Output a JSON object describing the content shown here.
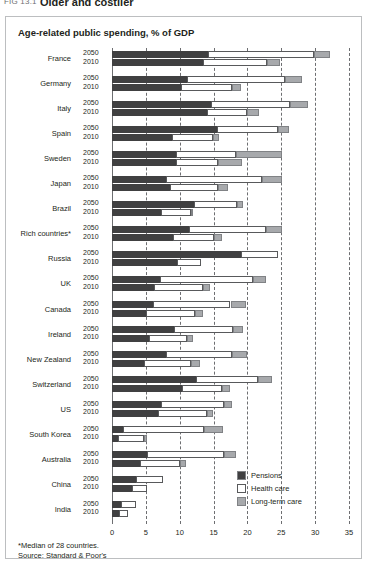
{
  "figure": {
    "label": "FIG 13.1",
    "caption": "Older and costlier"
  },
  "chart_title": "Age-related public spending, % of GDP",
  "notes": {
    "footnote": "*Median of 28 countries.",
    "source": "Source: Standard & Poor's"
  },
  "legend": {
    "position": "bottom-right",
    "items": [
      {
        "label": "Pensions",
        "color": "#404041"
      },
      {
        "label": "Health care",
        "color": "#ffffff"
      },
      {
        "label": "Long-term care",
        "color": "#a7a9ac"
      }
    ]
  },
  "chart_data": {
    "type": "bar",
    "orientation": "horizontal",
    "stacked": true,
    "title": "Age-related public spending, % of GDP",
    "xlabel": "",
    "ylabel": "",
    "xlim": [
      0,
      35
    ],
    "xticks": [
      0,
      5,
      10,
      15,
      20,
      25,
      30,
      35
    ],
    "grid": true,
    "series_names": [
      "Pensions",
      "Health care",
      "Long-term care"
    ],
    "year_labels": [
      "2050",
      "2010"
    ],
    "categories": [
      "France",
      "Germany",
      "Italy",
      "Spain",
      "Sweden",
      "Japan",
      "Brazil",
      "Rich countries*",
      "Russia",
      "UK",
      "Canada",
      "Ireland",
      "New Zealand",
      "Switzerland",
      "US",
      "South Korea",
      "Australia",
      "China",
      "India"
    ],
    "rows": [
      {
        "country": "France",
        "year": "2050",
        "pensions": 14.2,
        "health": 15.6,
        "longterm": 2.4,
        "total": 32.2
      },
      {
        "country": "France",
        "year": "2010",
        "pensions": 13.5,
        "health": 9.4,
        "longterm": 1.9,
        "total": 24.8
      },
      {
        "country": "Germany",
        "year": "2050",
        "pensions": 11.1,
        "health": 14.5,
        "longterm": 2.5,
        "total": 28.1
      },
      {
        "country": "Germany",
        "year": "2010",
        "pensions": 10.2,
        "health": 7.5,
        "longterm": 1.3,
        "total": 19.0
      },
      {
        "country": "Italy",
        "year": "2050",
        "pensions": 14.6,
        "health": 11.7,
        "longterm": 2.6,
        "total": 28.9
      },
      {
        "country": "Italy",
        "year": "2010",
        "pensions": 14.0,
        "health": 5.9,
        "longterm": 1.8,
        "total": 21.7
      },
      {
        "country": "Spain",
        "year": "2050",
        "pensions": 15.5,
        "health": 9.0,
        "longterm": 1.6,
        "total": 26.1
      },
      {
        "country": "Spain",
        "year": "2010",
        "pensions": 8.9,
        "health": 6.0,
        "longterm": 0.9,
        "total": 15.8
      },
      {
        "country": "Sweden",
        "year": "2050",
        "pensions": 9.4,
        "health": 8.9,
        "longterm": 6.8,
        "total": 25.1
      },
      {
        "country": "Sweden",
        "year": "2010",
        "pensions": 9.5,
        "health": 6.1,
        "longterm": 3.6,
        "total": 19.2
      },
      {
        "country": "Japan",
        "year": "2050",
        "pensions": 8.0,
        "health": 14.1,
        "longterm": 3.0,
        "total": 25.1
      },
      {
        "country": "Japan",
        "year": "2010",
        "pensions": 8.6,
        "health": 7.0,
        "longterm": 1.5,
        "total": 17.1
      },
      {
        "country": "Brazil",
        "year": "2050",
        "pensions": 12.1,
        "health": 6.3,
        "longterm": 0.9,
        "total": 19.3
      },
      {
        "country": "Brazil",
        "year": "2010",
        "pensions": 7.2,
        "health": 4.4,
        "longterm": 0.4,
        "total": 12.0
      },
      {
        "country": "Rich countries*",
        "year": "2050",
        "pensions": 11.4,
        "health": 11.3,
        "longterm": 2.4,
        "total": 25.1
      },
      {
        "country": "Rich countries*",
        "year": "2010",
        "pensions": 9.0,
        "health": 6.1,
        "longterm": 1.1,
        "total": 16.2
      },
      {
        "country": "Russia",
        "year": "2050",
        "pensions": 19.0,
        "health": 5.5,
        "longterm": 0.0,
        "total": 24.5
      },
      {
        "country": "Russia",
        "year": "2010",
        "pensions": 9.6,
        "health": 3.6,
        "longterm": 0.0,
        "total": 13.2
      },
      {
        "country": "UK",
        "year": "2050",
        "pensions": 7.1,
        "health": 13.7,
        "longterm": 1.9,
        "total": 22.7
      },
      {
        "country": "UK",
        "year": "2010",
        "pensions": 6.2,
        "health": 7.3,
        "longterm": 1.0,
        "total": 14.5
      },
      {
        "country": "Canada",
        "year": "2050",
        "pensions": 6.1,
        "health": 11.4,
        "longterm": 2.3,
        "total": 19.8
      },
      {
        "country": "Canada",
        "year": "2010",
        "pensions": 5.0,
        "health": 7.3,
        "longterm": 1.2,
        "total": 13.5
      },
      {
        "country": "Ireland",
        "year": "2050",
        "pensions": 9.2,
        "health": 8.6,
        "longterm": 1.6,
        "total": 19.4
      },
      {
        "country": "Ireland",
        "year": "2010",
        "pensions": 5.5,
        "health": 5.6,
        "longterm": 0.8,
        "total": 11.9
      },
      {
        "country": "New Zealand",
        "year": "2050",
        "pensions": 8.0,
        "health": 9.7,
        "longterm": 2.3,
        "total": 20.0
      },
      {
        "country": "New Zealand",
        "year": "2010",
        "pensions": 4.7,
        "health": 7.0,
        "longterm": 1.3,
        "total": 13.0
      },
      {
        "country": "Switzerland",
        "year": "2050",
        "pensions": 12.4,
        "health": 9.2,
        "longterm": 2.1,
        "total": 23.7
      },
      {
        "country": "Switzerland",
        "year": "2010",
        "pensions": 10.4,
        "health": 5.8,
        "longterm": 1.2,
        "total": 17.4
      },
      {
        "country": "US",
        "year": "2050",
        "pensions": 7.2,
        "health": 9.3,
        "longterm": 1.2,
        "total": 17.7
      },
      {
        "country": "US",
        "year": "2010",
        "pensions": 6.8,
        "health": 7.3,
        "longterm": 0.8,
        "total": 14.9
      },
      {
        "country": "South Korea",
        "year": "2050",
        "pensions": 1.6,
        "health": 12.0,
        "longterm": 2.8,
        "total": 16.4
      },
      {
        "country": "South Korea",
        "year": "2010",
        "pensions": 0.9,
        "health": 3.8,
        "longterm": 0.5,
        "total": 5.2
      },
      {
        "country": "Australia",
        "year": "2050",
        "pensions": 5.1,
        "health": 11.4,
        "longterm": 1.8,
        "total": 18.3
      },
      {
        "country": "Australia",
        "year": "2010",
        "pensions": 4.2,
        "health": 5.9,
        "longterm": 0.9,
        "total": 11.0
      },
      {
        "country": "China",
        "year": "2050",
        "pensions": 3.5,
        "health": 4.0,
        "longterm": 0.0,
        "total": 7.5
      },
      {
        "country": "China",
        "year": "2010",
        "pensions": 2.9,
        "health": 2.3,
        "longterm": 0.0,
        "total": 5.2
      },
      {
        "country": "India",
        "year": "2050",
        "pensions": 1.4,
        "health": 2.1,
        "longterm": 0.0,
        "total": 3.5
      },
      {
        "country": "India",
        "year": "2010",
        "pensions": 1.1,
        "health": 1.2,
        "longterm": 0.0,
        "total": 2.3
      }
    ]
  }
}
